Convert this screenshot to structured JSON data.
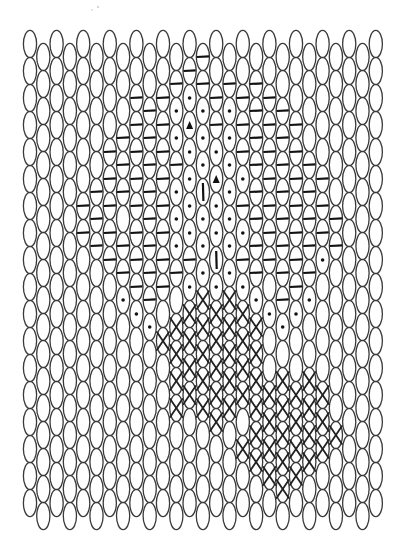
{
  "pattern": {
    "title": "",
    "columns": 27,
    "rows_per_column": 18,
    "legend": {
      ".": "blank",
      "-": "horizontal-dash",
      "o": "dot",
      "^": "filled-triangle",
      "|": "vertical-bar",
      "x": "cross"
    },
    "colors": {
      "ink": "#111111",
      "oval": "#3a3a3a",
      "background": "#ffffff"
    },
    "grid": [
      "..................",
      "..................",
      "..................",
      "..................",
      "......--..........",
      ".....---..........",
      "....-----.........",
      "...---.--o........",
      "..--------o.......",
      "..--------o.......",
      "..--------.x......",
      ".-oo-ooo-.xxxx....",
      ".-o^oooo-oxxxx....",
      "--ooo|oooxxxxx....",
      "..--o^oo|oxxxxx...",
      ".-oooooooxxxxx....",
      "..---o-o-oxxxx.x..",
      ".--------oxxxxxx..",
      "..-------.o..xxxx.",
      "..--------o.xxxxx.",
      "...-------o..xxxx.",
      "....-----o..xxxx..",
      ".....---o....xxx..",
      "......--......x...",
      "..................",
      "..................",
      ".................."
    ]
  }
}
